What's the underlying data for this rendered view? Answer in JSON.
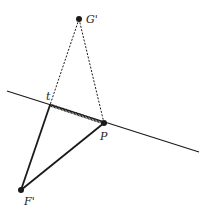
{
  "diagram": {
    "points": {
      "G": {
        "label": "G'",
        "x": 79,
        "y": 19
      },
      "t": {
        "label": "t",
        "x": 50,
        "y": 105
      },
      "P": {
        "label": "P",
        "x": 104,
        "y": 123
      },
      "F": {
        "label": "F'",
        "x": 21,
        "y": 190
      }
    },
    "line": {
      "x1": 7,
      "y1": 91,
      "x2": 199,
      "y2": 152
    },
    "colors": {
      "stroke": "#1a1a1a",
      "background": "#ffffff"
    }
  }
}
